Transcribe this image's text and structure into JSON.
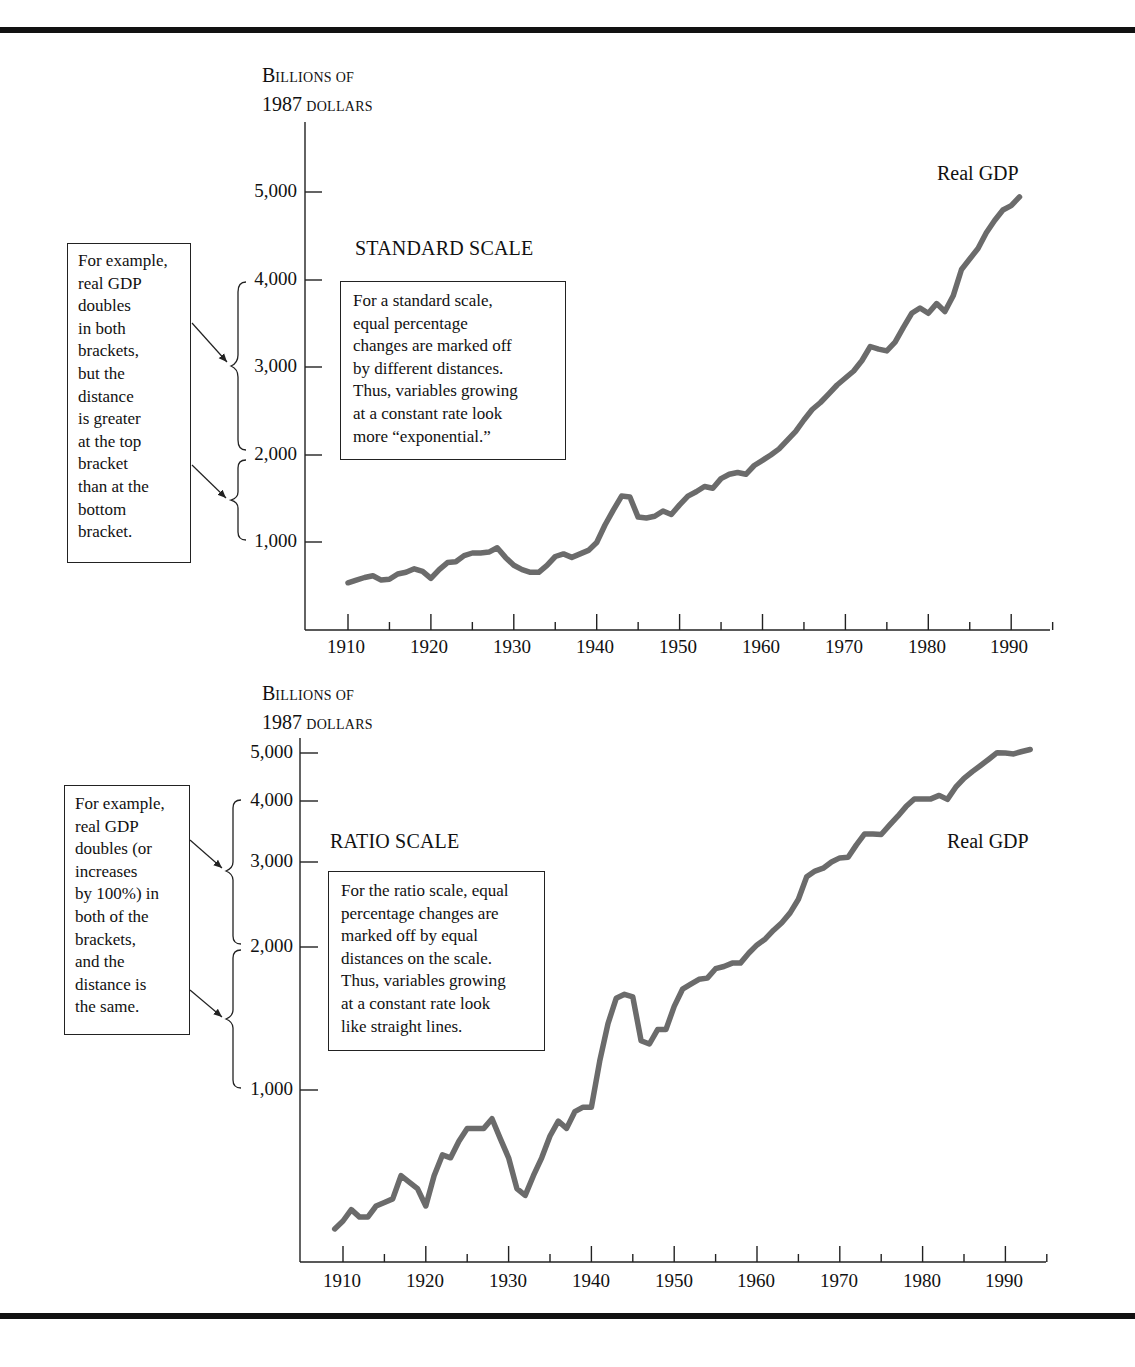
{
  "chart_data": [
    {
      "type": "line",
      "title": "STANDARD SCALE",
      "ylabel": "Billions of 1987 dollars",
      "ylabel_lines": [
        "Billions of",
        "1987 dollars"
      ],
      "xlabel": "",
      "scale": "linear",
      "yticks": [
        "1,000",
        "2,000",
        "3,000",
        "4,000",
        "5,000"
      ],
      "xticks": [
        "1910",
        "1920",
        "1930",
        "1940",
        "1950",
        "1960",
        "1970",
        "1980",
        "1990"
      ],
      "ylim": [
        0,
        5800
      ],
      "xlim": [
        1905,
        1995
      ],
      "grid": false,
      "legend": "inline label",
      "series": [
        {
          "name": "Real GDP",
          "x": [
            1910,
            1911,
            1912,
            1913,
            1914,
            1915,
            1916,
            1917,
            1918,
            1919,
            1920,
            1921,
            1922,
            1923,
            1924,
            1925,
            1926,
            1927,
            1928,
            1929,
            1930,
            1931,
            1932,
            1933,
            1934,
            1935,
            1936,
            1937,
            1938,
            1939,
            1940,
            1941,
            1942,
            1943,
            1944,
            1945,
            1946,
            1947,
            1948,
            1949,
            1950,
            1951,
            1952,
            1953,
            1954,
            1955,
            1956,
            1957,
            1958,
            1959,
            1960,
            1961,
            1962,
            1963,
            1964,
            1965,
            1966,
            1967,
            1968,
            1969,
            1970,
            1971,
            1972,
            1973,
            1974,
            1975,
            1976,
            1977,
            1978,
            1979,
            1980,
            1981,
            1982,
            1983,
            1984,
            1985,
            1986,
            1987,
            1988,
            1989,
            1990,
            1991
          ],
          "values": [
            540,
            570,
            600,
            620,
            570,
            580,
            640,
            660,
            700,
            670,
            590,
            690,
            770,
            780,
            850,
            880,
            880,
            890,
            940,
            830,
            740,
            690,
            660,
            660,
            740,
            840,
            870,
            830,
            870,
            910,
            1000,
            1200,
            1370,
            1530,
            1520,
            1290,
            1280,
            1300,
            1360,
            1320,
            1430,
            1530,
            1580,
            1640,
            1620,
            1730,
            1780,
            1800,
            1780,
            1880,
            1940,
            2000,
            2070,
            2170,
            2270,
            2400,
            2520,
            2600,
            2700,
            2800,
            2880,
            2960,
            3080,
            3240,
            3210,
            3190,
            3290,
            3460,
            3620,
            3680,
            3620,
            3730,
            3640,
            3820,
            4120,
            4240,
            4360,
            4540,
            4680,
            4800,
            4850,
            4950
          ],
          "color": "#6b6b6b"
        }
      ],
      "annotations": [
        {
          "text": "For a standard scale, equal percentage changes are marked off by different distances. Thus, variables growing at a constant rate look more “exponential.”"
        },
        {
          "text": "For example, real GDP doubles in both brackets, but the distance is greater at the top bracket than at the bottom bracket.",
          "brackets": [
            [
              2000,
              4000
            ],
            [
              1000,
              2000
            ]
          ]
        }
      ]
    },
    {
      "type": "line",
      "title": "RATIO SCALE",
      "ylabel": "Billions of 1987 dollars",
      "ylabel_lines": [
        "Billions of",
        "1987 dollars"
      ],
      "xlabel": "",
      "scale": "log",
      "yticks": [
        "1,000",
        "2,000",
        "3,000",
        "4,000",
        "5,000"
      ],
      "xticks": [
        "1910",
        "1920",
        "1930",
        "1940",
        "1950",
        "1960",
        "1970",
        "1980",
        "1990"
      ],
      "ylim": [
        400,
        5500
      ],
      "xlim": [
        1905,
        1995
      ],
      "grid": false,
      "legend": "inline label",
      "series": [
        {
          "name": "Real GDP",
          "x": [
            1909,
            1910,
            1911,
            1912,
            1913,
            1914,
            1915,
            1916,
            1917,
            1918,
            1919,
            1920,
            1921,
            1922,
            1923,
            1924,
            1925,
            1926,
            1927,
            1928,
            1929,
            1930,
            1931,
            1932,
            1933,
            1934,
            1935,
            1936,
            1937,
            1938,
            1939,
            1940,
            1941,
            1942,
            1943,
            1944,
            1945,
            1946,
            1947,
            1948,
            1949,
            1950,
            1951,
            1952,
            1953,
            1954,
            1955,
            1956,
            1957,
            1958,
            1959,
            1960,
            1961,
            1962,
            1963,
            1964,
            1965,
            1966,
            1967,
            1968,
            1969,
            1970,
            1971,
            1972,
            1973,
            1974,
            1975,
            1976,
            1977,
            1978,
            1979,
            1980,
            1981,
            1982,
            1983,
            1984,
            1985,
            1986,
            1987,
            1988,
            1989,
            1990,
            1991,
            1992,
            1993
          ],
          "values": [
            510,
            530,
            560,
            540,
            540,
            570,
            580,
            590,
            660,
            640,
            620,
            570,
            660,
            730,
            720,
            780,
            830,
            830,
            830,
            870,
            790,
            720,
            620,
            600,
            660,
            720,
            800,
            860,
            830,
            900,
            920,
            920,
            1150,
            1380,
            1560,
            1590,
            1570,
            1270,
            1250,
            1340,
            1340,
            1500,
            1630,
            1670,
            1710,
            1720,
            1800,
            1820,
            1850,
            1850,
            1940,
            2020,
            2080,
            2170,
            2250,
            2360,
            2520,
            2810,
            2890,
            2930,
            3020,
            3080,
            3090,
            3280,
            3460,
            3460,
            3450,
            3610,
            3770,
            3950,
            4100,
            4100,
            4100,
            4170,
            4090,
            4340,
            4530,
            4680,
            4820,
            4970,
            5130,
            5120,
            5100,
            5160,
            5210
          ],
          "color": "#6b6b6b"
        }
      ],
      "annotations": [
        {
          "text": "For the ratio scale, equal percentage changes are marked off by equal distances on the scale. Thus, variables growing at a constant rate look like straight lines."
        },
        {
          "text": "For example, real GDP doubles (or increases by 100%) in both of the brackets, and the distance is the same.",
          "brackets": [
            [
              2000,
              4000
            ],
            [
              1000,
              2000
            ]
          ]
        }
      ]
    }
  ],
  "top": {
    "ylabel_line1_cap": "B",
    "ylabel_line1_rest": "ILLIONS OF",
    "ylabel_line2_num": "1987",
    "ylabel_line2_rest": "DOLLARS",
    "title": "STANDARD SCALE",
    "series_label": "Real GDP",
    "yticks": [
      "5,000",
      "4,000",
      "3,000",
      "2,000",
      "1,000"
    ],
    "xticks": [
      "1910",
      "1920",
      "1930",
      "1940",
      "1950",
      "1960",
      "1970",
      "1980",
      "1990"
    ],
    "note_lines": [
      "For a standard scale,",
      "equal percentage",
      "changes are marked off",
      "by different distances.",
      "Thus, variables growing",
      "at a constant rate look",
      "more “exponential.”"
    ],
    "side_note_lines": [
      "For example,",
      "real GDP",
      "doubles",
      "in both",
      "brackets,",
      "but the",
      "distance",
      "is greater",
      "at the top",
      "bracket",
      "than at the",
      "bottom",
      "bracket."
    ]
  },
  "bottom": {
    "ylabel_line1_cap": "B",
    "ylabel_line1_rest": "ILLIONS OF",
    "ylabel_line2_num": "1987",
    "ylabel_line2_rest": "DOLLARS",
    "title": "RATIO SCALE",
    "series_label": "Real GDP",
    "yticks": [
      "5,000",
      "4,000",
      "3,000",
      "2,000",
      "1,000"
    ],
    "xticks": [
      "1910",
      "1920",
      "1930",
      "1940",
      "1950",
      "1960",
      "1970",
      "1980",
      "1990"
    ],
    "note_lines": [
      "For the ratio scale, equal",
      "percentage changes are",
      "marked off by equal",
      "distances on the scale.",
      "Thus, variables growing",
      "at a constant rate look",
      "like straight lines."
    ],
    "side_note_lines": [
      "For example,",
      "real GDP",
      "doubles (or",
      "increases",
      "by 100%) in",
      "both of the",
      "brackets,",
      "and the",
      "distance is",
      "the same."
    ]
  }
}
